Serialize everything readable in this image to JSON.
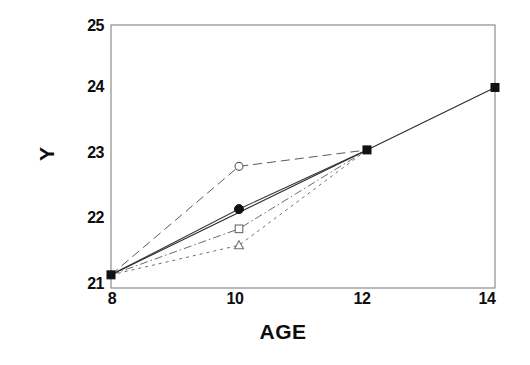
{
  "chart_data": {
    "type": "line",
    "title": "",
    "xlabel": "AGE",
    "ylabel": "Y",
    "xlim": [
      8,
      14
    ],
    "ylim": [
      21,
      25
    ],
    "xticks": [
      8,
      10,
      12,
      14
    ],
    "yticks": [
      21,
      22,
      23,
      24,
      25
    ],
    "xtick_labels": [
      "8",
      "10",
      "12",
      "14"
    ],
    "ytick_labels": [
      "21",
      "22",
      "23",
      "24",
      "25"
    ],
    "grid": false,
    "legend": "none",
    "frame": "box",
    "series": [
      {
        "name": "series-1",
        "marker": "open-circle",
        "linestyle": "long-dash",
        "color": "#5a5a5a",
        "x": [
          8,
          10,
          12
        ],
        "values": [
          21.2,
          22.85,
          23.1
        ]
      },
      {
        "name": "series-2",
        "marker": "filled-circle",
        "linestyle": "solid",
        "color": "#3a3a3a",
        "x": [
          8,
          10,
          12
        ],
        "values": [
          21.2,
          22.2,
          23.1
        ]
      },
      {
        "name": "series-3",
        "marker": "open-square",
        "linestyle": "dash-dot",
        "color": "#6a6a6a",
        "x": [
          8,
          10,
          12
        ],
        "values": [
          21.2,
          21.9,
          23.1
        ]
      },
      {
        "name": "series-4",
        "marker": "open-triangle",
        "linestyle": "short-dash",
        "color": "#707070",
        "x": [
          8,
          10,
          12
        ],
        "values": [
          21.2,
          21.65,
          23.1
        ]
      },
      {
        "name": "series-main",
        "marker": "filled-square",
        "linestyle": "solid",
        "color": "#2b2b2b",
        "x": [
          8,
          12,
          14
        ],
        "values": [
          21.2,
          23.1,
          24.05
        ]
      }
    ],
    "colors": {
      "frame": "#8c8c8c",
      "axis_text": "#0d0d0d",
      "background": "#ffffff",
      "marker_fill": "#111111"
    }
  }
}
